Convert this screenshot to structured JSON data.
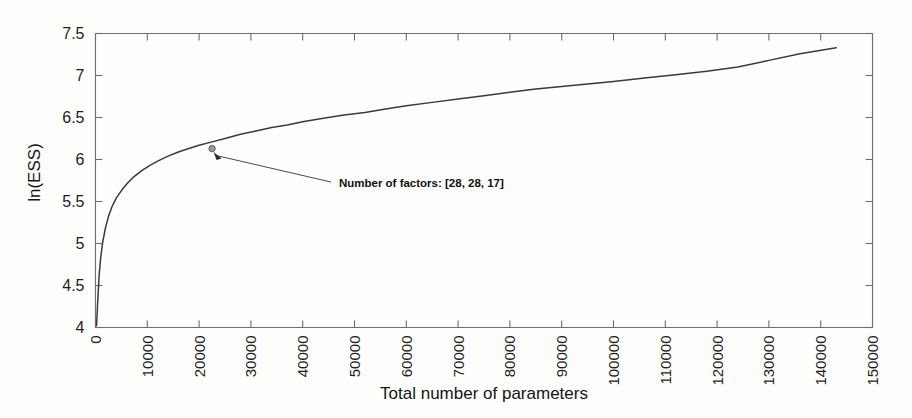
{
  "chart_data": {
    "type": "line",
    "title": "",
    "xlabel": "Total number of parameters",
    "ylabel": "ln(ESS)",
    "xlim": [
      0,
      150000
    ],
    "ylim": [
      4,
      7.5
    ],
    "grid": false,
    "legend": null,
    "xticks": [
      0,
      10000,
      20000,
      30000,
      40000,
      50000,
      60000,
      70000,
      80000,
      90000,
      100000,
      110000,
      120000,
      130000,
      140000,
      150000
    ],
    "xtick_labels": [
      "0",
      "10000",
      "20000",
      "30000",
      "40000",
      "50000",
      "60000",
      "70000",
      "80000",
      "90000",
      "100000",
      "110000",
      "120000",
      "130000",
      "140000",
      "150000"
    ],
    "yticks": [
      4,
      4.5,
      5,
      5.5,
      6,
      6.5,
      7,
      7.5
    ],
    "ytick_labels": [
      "4",
      "4.5",
      "5",
      "5.5",
      "6",
      "6.5",
      "7",
      "7.5"
    ],
    "series": [
      {
        "name": "ln(ESS) vs total number of parameters",
        "color": "#3a3a3a",
        "x": [
          200,
          400,
          700,
          1000,
          1400,
          1900,
          2500,
          3200,
          4000,
          5000,
          6200,
          7500,
          9000,
          10500,
          12000,
          14000,
          16000,
          18000,
          20000,
          22500,
          25000,
          28000,
          31000,
          34000,
          37000,
          40000,
          44000,
          48000,
          52000,
          56000,
          60000,
          65000,
          70000,
          75000,
          80000,
          85000,
          90000,
          95000,
          100000,
          106000,
          112000,
          118000,
          124000,
          130000,
          136000,
          143000
        ],
        "y": [
          4.02,
          4.28,
          4.62,
          4.83,
          5.02,
          5.18,
          5.32,
          5.44,
          5.54,
          5.63,
          5.72,
          5.8,
          5.87,
          5.93,
          5.98,
          6.04,
          6.09,
          6.13,
          6.17,
          6.21,
          6.25,
          6.3,
          6.34,
          6.38,
          6.41,
          6.45,
          6.49,
          6.53,
          6.56,
          6.6,
          6.64,
          6.68,
          6.72,
          6.76,
          6.8,
          6.84,
          6.87,
          6.9,
          6.93,
          6.97,
          7.01,
          7.05,
          7.1,
          7.18,
          7.26,
          7.33
        ]
      }
    ],
    "annotations": [
      {
        "text": "Number of factors: [28, 28, 17]",
        "point_x": 22500,
        "point_y": 6.13,
        "marker": "circle",
        "label_x": 47000,
        "label_y": 5.72
      }
    ]
  },
  "axes": {
    "y_axis_title": "ln(ESS)",
    "x_axis_title": "Total number of parameters"
  },
  "colors": {
    "curve": "#3a3a3a",
    "axis": "#6e6e6e",
    "text": "#141414",
    "background": "#fdfdfc"
  }
}
